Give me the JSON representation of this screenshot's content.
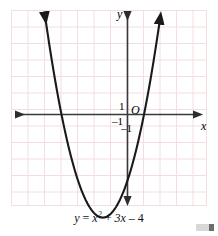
{
  "figure": {
    "caption": "y = x",
    "equation": {
      "lhs": "y",
      "equals": "=",
      "term1_base": "x",
      "term1_exp": "2",
      "plus": "+",
      "term2": "3x",
      "minus": "–",
      "term3": "4",
      "full": "y = x2 + 3x – 4"
    },
    "axis_labels": {
      "x": "x",
      "y": "y",
      "origin": "O"
    },
    "tick_labels": {
      "y_positive_one": "1",
      "x_negative_one": "–1",
      "y_negative_one": "–1"
    }
  },
  "colors": {
    "grid_line": "#f0dede",
    "grid_border": "#eadada",
    "curve": "#1a1a1a",
    "axis": "#3a3a3a",
    "text": "#000000",
    "corner_mark_light": "#d8d8d8",
    "corner_mark_dark": "#6e6e6e",
    "background": "#ffffff"
  },
  "chart_data": {
    "type": "line",
    "title": "",
    "subtitle": "",
    "xlabel": "x",
    "ylabel": "y",
    "annotations": [
      "y = x2 + 3x – 4",
      "O",
      "1",
      "–1"
    ],
    "grid": true,
    "legend": "none",
    "xlim": [
      -7,
      5
    ],
    "ylim": [
      -7,
      5
    ],
    "xticks": [
      -7,
      -6,
      -5,
      -4,
      -3,
      -2,
      -1,
      0,
      1,
      2,
      3,
      4,
      5
    ],
    "yticks": [
      -7,
      -6,
      -5,
      -4,
      -3,
      -2,
      -1,
      0,
      1,
      2,
      3,
      4,
      5
    ],
    "function": "y = x^2 + 3x - 4",
    "coefficients": {
      "a": 1,
      "b": 3,
      "c": -4
    },
    "roots": [
      -4,
      1
    ],
    "vertex": [
      -1.5,
      -6.25
    ],
    "y_intercept": -4,
    "series": [
      {
        "name": "y = x2 + 3x – 4",
        "x": [
          -5.2,
          -5.0,
          -4.5,
          -4.0,
          -3.5,
          -3.0,
          -2.5,
          -2.0,
          -1.5,
          -1.0,
          -0.5,
          0.0,
          0.5,
          1.0,
          1.5,
          2.0,
          2.2
        ],
        "values": [
          8.04,
          6.0,
          2.75,
          0.0,
          -2.25,
          -4.0,
          -5.25,
          -6.0,
          -6.25,
          -6.0,
          -5.25,
          -4.0,
          -2.25,
          0.0,
          2.75,
          6.0,
          7.44
        ]
      }
    ]
  }
}
